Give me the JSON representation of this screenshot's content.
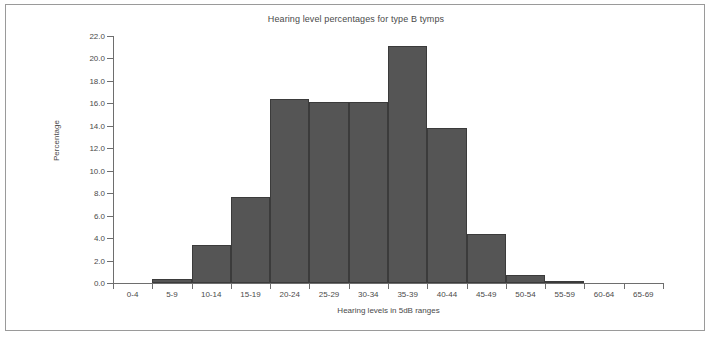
{
  "chart_data": {
    "type": "bar",
    "title": "Hearing level percentages for type B tymps",
    "xlabel": "Hearing levels in 5dB ranges",
    "ylabel": "Percentage",
    "categories": [
      "0-4",
      "5-9",
      "10-14",
      "15-19",
      "20-24",
      "25-29",
      "30-34",
      "35-39",
      "40-44",
      "45-49",
      "50-54",
      "55-59",
      "60-64",
      "65-69"
    ],
    "values": [
      0.0,
      0.35,
      3.4,
      7.7,
      16.4,
      16.1,
      16.1,
      21.1,
      13.8,
      4.4,
      0.7,
      0.2,
      0.0,
      0.0
    ],
    "ylim": [
      0.0,
      22.0
    ],
    "ytick_labels": [
      "0.0",
      "2.0",
      "4.0",
      "6.0",
      "8.0",
      "10.0",
      "12.0",
      "14.0",
      "16.0",
      "18.0",
      "20.0",
      "22.0"
    ],
    "ytick_values": [
      0,
      2,
      4,
      6,
      8,
      10,
      12,
      14,
      16,
      18,
      20,
      22
    ],
    "grid": false,
    "legend": false,
    "bar_color": "#555555",
    "bar_edge_color": "#3b3b3b",
    "axis_color": "#6e6e6e",
    "text_color": "#4a4a4a",
    "frame_color": "#9a9a9a",
    "background": "#ffffff"
  }
}
